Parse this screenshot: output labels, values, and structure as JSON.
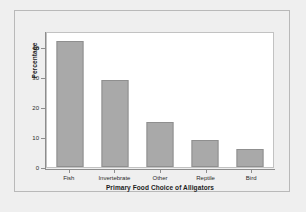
{
  "chart_data": {
    "type": "bar",
    "title": "",
    "xlabel": "Primary Food Choice of Alligators",
    "ylabel": "Percentage",
    "categories": [
      "Fish",
      "Invertebrate",
      "Other",
      "Reptile",
      "Bird"
    ],
    "values": [
      42,
      29,
      15,
      9,
      6
    ],
    "ylim": [
      0,
      45.5
    ],
    "yticks": [
      0,
      10,
      20,
      30,
      40
    ],
    "ytick_labels": [
      "0",
      "10",
      "20",
      "30",
      "40"
    ],
    "grid": false,
    "legend": null,
    "orientation": "vertical",
    "bar_color": "#a9a9a9",
    "bar_edge_color": "#8f8f8f",
    "plot_background": "#ffffff",
    "figure_background": "#efefef"
  }
}
